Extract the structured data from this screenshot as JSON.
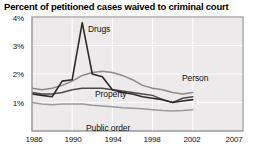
{
  "chart_data": {
    "type": "line",
    "title": "Percent of petitioned cases waived to criminal court",
    "xlabel": "",
    "ylabel": "",
    "xlim": [
      1986,
      2007
    ],
    "ylim": [
      0,
      4
    ],
    "grid": true,
    "legend_position": "inline-annotations",
    "xticks": [
      "1986",
      "1990",
      "1994",
      "1998",
      "2002",
      "2007"
    ],
    "xtick_values": [
      1986,
      1990,
      1994,
      1998,
      2002,
      2007
    ],
    "yticks": [
      "1%",
      "2%",
      "3%",
      "4%"
    ],
    "ytick_values": [
      1,
      2,
      3,
      4
    ],
    "x": [
      1986,
      1987,
      1988,
      1989,
      1990,
      1991,
      1992,
      1993,
      1994,
      1995,
      1996,
      1997,
      1998,
      1999,
      2000,
      2001,
      2002
    ],
    "series": [
      {
        "name": "Drugs",
        "color": "#2b2b2b",
        "values": [
          1.3,
          1.25,
          1.2,
          1.75,
          1.8,
          3.8,
          2.0,
          1.9,
          1.45,
          1.35,
          1.3,
          1.2,
          1.15,
          1.1,
          1.0,
          1.05,
          1.1
        ]
      },
      {
        "name": "Person",
        "color": "#8a8a8a",
        "values": [
          1.5,
          1.45,
          1.5,
          1.6,
          1.75,
          1.95,
          2.05,
          2.1,
          2.05,
          1.95,
          1.8,
          1.6,
          1.5,
          1.45,
          1.35,
          1.3,
          1.35
        ]
      },
      {
        "name": "Property",
        "color": "#4a4a4a",
        "values": [
          1.35,
          1.3,
          1.3,
          1.35,
          1.45,
          1.5,
          1.5,
          1.5,
          1.45,
          1.4,
          1.35,
          1.3,
          1.25,
          1.1,
          1.0,
          1.15,
          1.2
        ]
      },
      {
        "name": "Public order",
        "color": "#9a9a9a",
        "values": [
          1.0,
          0.95,
          0.92,
          0.95,
          0.95,
          0.95,
          0.9,
          0.88,
          0.85,
          0.82,
          0.8,
          0.78,
          0.75,
          0.72,
          0.7,
          0.72,
          0.75
        ]
      }
    ],
    "annotations": [
      {
        "text": "Drugs",
        "x_px": 88,
        "y_px": 9
      },
      {
        "text": "Person",
        "x_px": 182,
        "y_px": 58
      },
      {
        "text": "Property",
        "x_px": 95,
        "y_px": 74
      },
      {
        "text": "Public order",
        "x_px": 86,
        "y_px": 108
      }
    ]
  }
}
